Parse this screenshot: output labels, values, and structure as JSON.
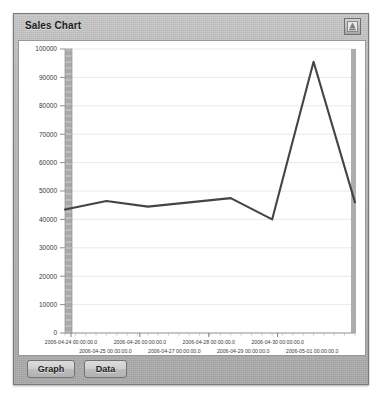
{
  "window": {
    "title": "Sales Chart",
    "minimize_icon": "minimize-icon"
  },
  "toolbar": {
    "graph_label": "Graph",
    "data_label": "Data"
  },
  "colors": {
    "line": "#444444",
    "panel_bg": "#ffffff",
    "window_bg": "#b9b9b9",
    "grid": "#e8e8ee",
    "axis_band": "#a8a8a8"
  },
  "chart_data": {
    "type": "line",
    "title": "Sales Chart",
    "xlabel": "",
    "ylabel": "",
    "grid": true,
    "legend": "none",
    "ylim": [
      0,
      100000
    ],
    "ytick_labels": [
      "100000",
      "90000",
      "80000",
      "70000",
      "60000",
      "50000",
      "40000",
      "30000",
      "20000",
      "10000",
      "0"
    ],
    "ytick_values": [
      100000,
      90000,
      80000,
      70000,
      60000,
      50000,
      40000,
      30000,
      20000,
      10000,
      0
    ],
    "xtick_labels_row1": [
      "2006-04-24 00:00:00.0",
      "2006-04-26 00:00:00.0",
      "2006-04-28 00:00:00.0",
      "2006-04-30 00:00:00.0"
    ],
    "xtick_labels_row2": [
      "2006-04-25 00:00:00.0",
      "2006-04-27 00:00:00.0",
      "2006-04-29 00:00:00.0",
      "2006-05-01 00:00:00.0"
    ],
    "x": [
      "2006-04-24 00:00:00.0",
      "2006-04-24 12:00:00.0",
      "2006-04-25 00:00:00.0",
      "2006-04-26 00:00:00.0",
      "2006-04-27 00:00:00.0",
      "2006-04-28 00:00:00.0",
      "2006-04-30 00:00:00.0",
      "2006-05-01 00:00:00.0"
    ],
    "values": [
      43500,
      46500,
      44500,
      46000,
      47500,
      40000,
      95500,
      46000
    ],
    "series": [
      {
        "name": "Sales",
        "values": [
          43500,
          46500,
          44500,
          46000,
          47500,
          40000,
          95500,
          46000
        ]
      }
    ]
  }
}
